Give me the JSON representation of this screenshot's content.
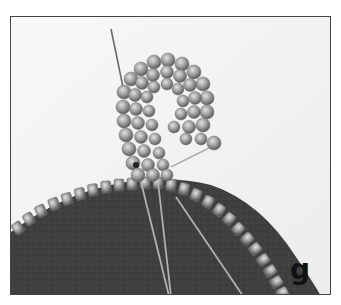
{
  "photo": {
    "subject": "beaded spiral curl stitched onto the edge of a dark felt disc with a needle and thread",
    "step_label": "g",
    "colors": {
      "background": "#f4f4f4",
      "felt": "#3e3e3e",
      "beads": "#9a9a9a",
      "bead_highlight": "#d6d6d6",
      "frame_border": "#444444",
      "label": "#111111"
    }
  }
}
